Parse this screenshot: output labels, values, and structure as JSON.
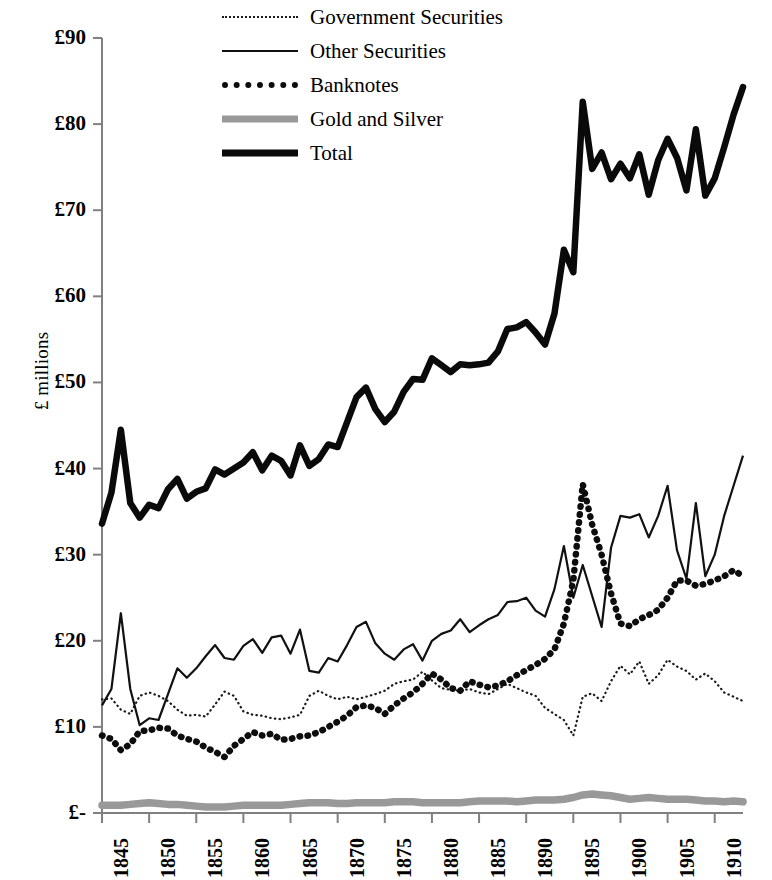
{
  "chart_data": {
    "type": "line",
    "title": "",
    "xlabel": "",
    "ylabel": "£ millions",
    "xlim": [
      1845,
      1913
    ],
    "ylim": [
      0,
      90
    ],
    "grid": false,
    "legend_position": "top-center",
    "y_ticks": [
      "£90",
      "£80",
      "£70",
      "£60",
      "£50",
      "£40",
      "£30",
      "£20",
      "£10",
      "£-"
    ],
    "y_tick_values": [
      90,
      80,
      70,
      60,
      50,
      40,
      30,
      20,
      10,
      0
    ],
    "x_ticks": [
      "1845",
      "1850",
      "1855",
      "1860",
      "1865",
      "1870",
      "1875",
      "1880",
      "1885",
      "1890",
      "1895",
      "1900",
      "1905",
      "1910"
    ],
    "x_tick_values": [
      1845,
      1850,
      1855,
      1860,
      1865,
      1870,
      1875,
      1880,
      1885,
      1890,
      1895,
      1900,
      1905,
      1910
    ],
    "x": [
      1845,
      1846,
      1847,
      1848,
      1849,
      1850,
      1851,
      1852,
      1853,
      1854,
      1855,
      1856,
      1857,
      1858,
      1859,
      1860,
      1861,
      1862,
      1863,
      1864,
      1865,
      1866,
      1867,
      1868,
      1869,
      1870,
      1871,
      1872,
      1873,
      1874,
      1875,
      1876,
      1877,
      1878,
      1879,
      1880,
      1881,
      1882,
      1883,
      1884,
      1885,
      1886,
      1887,
      1888,
      1889,
      1890,
      1891,
      1892,
      1893,
      1894,
      1895,
      1896,
      1897,
      1898,
      1899,
      1900,
      1901,
      1902,
      1903,
      1904,
      1905,
      1906,
      1907,
      1908,
      1909,
      1910,
      1911,
      1912,
      1913
    ],
    "series": [
      {
        "name": "Government Securities",
        "style": "fine-dotted",
        "color": "#1a1a1a",
        "values": [
          13.2,
          13.3,
          12.0,
          11.5,
          13.6,
          14.0,
          13.6,
          13.0,
          12.0,
          11.3,
          11.4,
          11.2,
          12.6,
          14.1,
          13.6,
          11.8,
          11.4,
          11.3,
          11.0,
          10.9,
          11.1,
          11.4,
          13.6,
          14.2,
          13.6,
          13.2,
          13.5,
          13.2,
          13.5,
          13.8,
          14.2,
          15.0,
          15.3,
          15.5,
          16.4,
          15.4,
          14.5,
          14.3,
          14.2,
          14.4,
          14.0,
          13.8,
          14.4,
          15.0,
          14.5,
          14.0,
          13.6,
          12.2,
          11.5,
          10.8,
          9.0,
          13.5,
          13.9,
          13.0,
          15.3,
          17.1,
          16.1,
          17.6,
          15.0,
          16.0,
          17.8,
          17.0,
          16.5,
          15.5,
          16.2,
          15.3,
          14.0,
          13.5,
          13.0
        ]
      },
      {
        "name": "Other Securities",
        "style": "thin-solid",
        "color": "#111111",
        "values": [
          12.5,
          14.4,
          23.2,
          14.4,
          10.2,
          11.0,
          10.8,
          13.8,
          16.8,
          15.7,
          16.8,
          18.2,
          19.5,
          18.0,
          17.8,
          19.4,
          20.2,
          18.6,
          20.4,
          20.6,
          18.5,
          21.3,
          16.5,
          16.3,
          18.0,
          17.6,
          19.5,
          21.6,
          22.2,
          19.7,
          18.5,
          17.8,
          19.0,
          19.6,
          17.7,
          20.0,
          20.8,
          21.2,
          22.5,
          21.0,
          21.8,
          22.5,
          23.0,
          24.5,
          24.6,
          25.0,
          23.5,
          22.8,
          26.0,
          31.0,
          25.0,
          28.8,
          25.2,
          21.6,
          30.8,
          34.5,
          34.3,
          34.7,
          32.0,
          34.5,
          38.0,
          30.5,
          27.2,
          36.0,
          27.5,
          30.0,
          34.5,
          38.0,
          41.5
        ]
      },
      {
        "name": "Banknotes",
        "style": "thick-dotted",
        "color": "#0d0d0d",
        "values": [
          9.0,
          8.6,
          7.3,
          8.0,
          9.5,
          9.6,
          9.9,
          9.8,
          9.0,
          8.6,
          8.3,
          7.6,
          7.1,
          6.5,
          7.8,
          8.6,
          9.4,
          9.0,
          9.2,
          8.5,
          8.6,
          8.9,
          9.0,
          9.4,
          10.0,
          10.6,
          11.3,
          12.3,
          12.5,
          12.2,
          11.5,
          12.5,
          13.3,
          14.0,
          15.0,
          16.2,
          15.5,
          14.5,
          14.2,
          15.3,
          14.9,
          14.6,
          14.8,
          15.3,
          16.0,
          16.6,
          17.2,
          17.9,
          19.0,
          22.0,
          27.0,
          38.2,
          33.5,
          30.0,
          25.5,
          22.0,
          21.7,
          22.5,
          23.0,
          23.6,
          25.0,
          27.0,
          27.0,
          26.4,
          26.6,
          27.0,
          27.5,
          28.2,
          27.5
        ]
      },
      {
        "name": "Gold and Silver",
        "style": "thick-gray",
        "color": "#999999",
        "values": [
          0.9,
          0.9,
          0.9,
          1.0,
          1.1,
          1.2,
          1.1,
          1.0,
          1.0,
          0.9,
          0.8,
          0.7,
          0.7,
          0.7,
          0.8,
          0.9,
          0.9,
          0.9,
          0.9,
          0.9,
          1.0,
          1.1,
          1.2,
          1.2,
          1.2,
          1.1,
          1.1,
          1.2,
          1.2,
          1.2,
          1.2,
          1.3,
          1.3,
          1.3,
          1.2,
          1.2,
          1.2,
          1.2,
          1.2,
          1.3,
          1.4,
          1.4,
          1.4,
          1.4,
          1.3,
          1.4,
          1.5,
          1.5,
          1.5,
          1.6,
          1.8,
          2.1,
          2.2,
          2.1,
          2.0,
          1.8,
          1.6,
          1.7,
          1.8,
          1.7,
          1.6,
          1.6,
          1.6,
          1.5,
          1.4,
          1.4,
          1.3,
          1.4,
          1.3
        ]
      },
      {
        "name": "Total",
        "style": "thick-black",
        "color": "#0a0a0a",
        "values": [
          33.6,
          37.2,
          44.5,
          36.0,
          34.3,
          35.8,
          35.4,
          37.6,
          38.8,
          36.5,
          37.3,
          37.7,
          39.9,
          39.3,
          40.0,
          40.7,
          41.9,
          39.8,
          41.5,
          40.9,
          39.2,
          42.7,
          40.3,
          41.1,
          42.8,
          42.5,
          45.4,
          48.3,
          49.4,
          46.9,
          45.4,
          46.6,
          48.9,
          50.4,
          50.3,
          52.8,
          52.0,
          51.2,
          52.1,
          52.0,
          52.1,
          52.3,
          53.6,
          56.2,
          56.4,
          57.0,
          55.8,
          54.4,
          58.0,
          65.4,
          62.8,
          82.6,
          74.8,
          76.7,
          73.6,
          75.4,
          73.7,
          76.5,
          71.8,
          75.8,
          78.3,
          76.1,
          72.3,
          79.4,
          71.7,
          73.7,
          77.3,
          81.1,
          84.3
        ]
      }
    ]
  },
  "legend": {
    "items": [
      {
        "label": "Government Securities",
        "key": "k-govt"
      },
      {
        "label": "Other Securities",
        "key": "k-other"
      },
      {
        "label": "Banknotes",
        "key": "k-bank"
      },
      {
        "label": "Gold and Silver",
        "key": "k-gold"
      },
      {
        "label": "Total",
        "key": "k-total"
      }
    ]
  }
}
